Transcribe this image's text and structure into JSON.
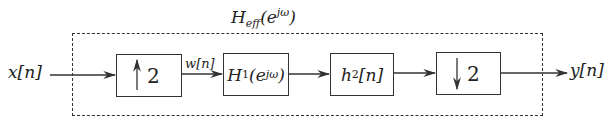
{
  "diagram": {
    "title_main": "H",
    "title_sub": "eff",
    "title_arg": "(e",
    "title_sup": "jω",
    "title_close": ")",
    "input_label": "x[n]",
    "output_label": "y[n]",
    "intermediate_label": "w[n]",
    "blocks": [
      {
        "id": "upsampler",
        "factor": "2",
        "direction": "up"
      },
      {
        "id": "H1",
        "main": "H",
        "sub": "1",
        "arg": "(e",
        "sup": "jω",
        "close": ")"
      },
      {
        "id": "h2",
        "main": "h",
        "sub": "2",
        "arg": "[n]"
      },
      {
        "id": "downsampler",
        "factor": "2",
        "direction": "down"
      }
    ]
  }
}
